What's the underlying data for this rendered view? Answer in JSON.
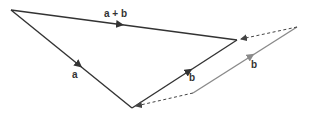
{
  "diagram": {
    "colors": {
      "primary": "#333333",
      "secondary": "#8a8a8a",
      "dashed": "#444444",
      "background": "#ffffff"
    },
    "points": {
      "origin": [
        11,
        10
      ],
      "a_end": [
        132,
        108
      ],
      "sum_end": [
        237,
        40
      ],
      "b_copy_start": [
        193,
        93
      ],
      "b_copy_end": [
        297,
        27
      ]
    },
    "vectors": [
      {
        "id": "a",
        "label": "a",
        "from": "origin",
        "to": "a_end",
        "style": "solid-dark"
      },
      {
        "id": "b",
        "label": "b",
        "from": "a_end",
        "to": "sum_end",
        "style": "solid-dark"
      },
      {
        "id": "a_plus_b",
        "label": "a + b",
        "from": "origin",
        "to": "sum_end",
        "style": "solid-dark"
      },
      {
        "id": "b_translated",
        "label": "b",
        "from": "b_copy_start",
        "to": "b_copy_end",
        "style": "solid-gray"
      }
    ],
    "guides": [
      {
        "id": "dashed-top",
        "from": "b_copy_end",
        "to": "sum_end",
        "style": "dashed",
        "arrow": "end"
      },
      {
        "id": "dashed-bottom",
        "from": "b_copy_start",
        "to": "a_end",
        "style": "dashed",
        "arrow": "end"
      }
    ],
    "labels": {
      "a_plus_b": "a + b",
      "a": "a",
      "b": "b",
      "b_translated": "b"
    }
  }
}
